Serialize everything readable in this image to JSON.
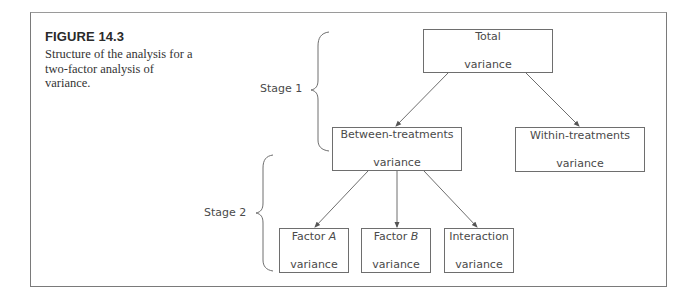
{
  "figure": {
    "label": "FIGURE 14.3",
    "caption": "Structure of the analysis for a two-factor analysis of variance."
  },
  "stages": [
    {
      "label": "Stage 1"
    },
    {
      "label": "Stage 2"
    }
  ],
  "nodes": {
    "total": {
      "line1": "Total",
      "line2": "variance"
    },
    "between": {
      "line1": "Between-treatments",
      "line2": "variance"
    },
    "within": {
      "line1": "Within-treatments",
      "line2": "variance"
    },
    "factor_a": {
      "prefix": "Factor ",
      "italic": "A",
      "line2": "variance"
    },
    "factor_b": {
      "prefix": "Factor ",
      "italic": "B",
      "line2": "variance"
    },
    "interaction": {
      "line1": "Interaction",
      "line2": "variance"
    }
  },
  "edges": [
    {
      "from": "total",
      "to": "between"
    },
    {
      "from": "total",
      "to": "within"
    },
    {
      "from": "between",
      "to": "factor_a"
    },
    {
      "from": "between",
      "to": "factor_b"
    },
    {
      "from": "between",
      "to": "interaction"
    }
  ]
}
